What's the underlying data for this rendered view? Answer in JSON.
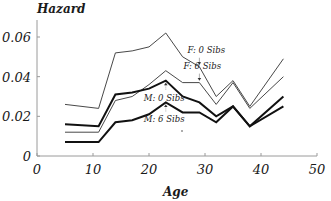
{
  "chart_data": {
    "type": "line",
    "title": "",
    "xlabel": "Age",
    "ylabel": "Hazard",
    "xlim": [
      0,
      50
    ],
    "ylim": [
      0,
      0.07
    ],
    "xticks": [
      0,
      10,
      20,
      30,
      40,
      50
    ],
    "xtick_labels": [
      "0",
      "10",
      "20",
      "30",
      "40",
      "50"
    ],
    "yticks": [
      0,
      0.02,
      0.04,
      0.06
    ],
    "ytick_labels": [
      "0",
      "0.02",
      "0.04",
      "0.06"
    ],
    "grid": false,
    "legend": "none",
    "x": [
      5,
      11,
      14,
      17,
      20,
      23,
      26,
      29,
      32,
      35,
      38,
      44
    ],
    "series": [
      {
        "name": "F: 0 Sibs",
        "weight": "thin",
        "values": [
          0.026,
          0.024,
          0.052,
          0.053,
          0.055,
          0.062,
          0.05,
          0.045,
          0.03,
          0.038,
          0.025,
          0.049
        ]
      },
      {
        "name": "F: 6 Sibs",
        "weight": "thin",
        "values": [
          0.012,
          0.012,
          0.028,
          0.03,
          0.036,
          0.043,
          0.037,
          0.037,
          0.026,
          0.037,
          0.024,
          0.04
        ]
      },
      {
        "name": "M: 0 Sibs",
        "weight": "thick",
        "values": [
          0.016,
          0.015,
          0.031,
          0.032,
          0.034,
          0.038,
          0.03,
          0.027,
          0.02,
          0.025,
          0.015,
          0.03
        ]
      },
      {
        "name": "M: 6 Sibs",
        "weight": "thick",
        "values": [
          0.007,
          0.007,
          0.017,
          0.018,
          0.021,
          0.027,
          0.022,
          0.022,
          0.017,
          0.025,
          0.015,
          0.025
        ]
      }
    ],
    "annotations": [
      {
        "text": "F: 0 Sibs",
        "series": "F: 0 Sibs",
        "x": 29,
        "y": 0.045
      },
      {
        "text": "F: 6 Sibs",
        "series": "F: 6 Sibs",
        "x": 29,
        "y": 0.037
      },
      {
        "text": "M: 0 Sibs",
        "series": "M: 0 Sibs",
        "x": 23,
        "y": 0.038
      },
      {
        "text": "M: 6 Sibs",
        "series": "M: 6 Sibs",
        "x": 23,
        "y": 0.027
      }
    ]
  }
}
